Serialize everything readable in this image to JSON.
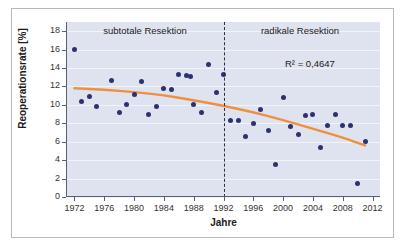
{
  "figure": {
    "background_color": "#ffffff",
    "frame_border_color": "#b8b8b8"
  },
  "chart_data": {
    "type": "scatter",
    "title": "",
    "xlabel": "Jahre",
    "ylabel": "Reoperationsrate [%]",
    "xlim": [
      1971,
      2013
    ],
    "ylim": [
      0,
      19
    ],
    "grid": true,
    "plot_background": "#dfe3ef",
    "point_color": "#2c3270",
    "trendline_color": "#ef9040",
    "xticks": [
      1972,
      1976,
      1980,
      1984,
      1988,
      1992,
      1996,
      2000,
      2004,
      2008,
      2012
    ],
    "xtick_labels": [
      "1972",
      "1976",
      "1980",
      "1984",
      "1988",
      "1992",
      "1996",
      "2000",
      "2004",
      "2008",
      "2012"
    ],
    "yticks": [
      0,
      2,
      4,
      6,
      8,
      10,
      12,
      14,
      16,
      18
    ],
    "ytick_labels": [
      "0",
      "2",
      "4",
      "6",
      "8",
      "10",
      "12",
      "14",
      "16",
      "18"
    ],
    "annotations": [
      {
        "name": "panel-label-left",
        "text": "subtotale Resektion",
        "x": 1981,
        "y": 18.7
      },
      {
        "name": "panel-label-right",
        "text": "radikale Resektion",
        "x": 2002,
        "y": 18.7
      },
      {
        "name": "r2-annotation",
        "text": "R² = 0,4647",
        "value": "0,4647",
        "x": 2006,
        "y": 15.2
      }
    ],
    "divider": {
      "x": 1992,
      "style": "dashed",
      "color": "#2b2f45"
    },
    "points": [
      {
        "x": 1972,
        "y": 16.0
      },
      {
        "x": 1973,
        "y": 10.35
      },
      {
        "x": 1974,
        "y": 10.9
      },
      {
        "x": 1975,
        "y": 9.8
      },
      {
        "x": 1977,
        "y": 12.6
      },
      {
        "x": 1978,
        "y": 9.15
      },
      {
        "x": 1979,
        "y": 10.05
      },
      {
        "x": 1980,
        "y": 11.1
      },
      {
        "x": 1981,
        "y": 12.5
      },
      {
        "x": 1982,
        "y": 8.95
      },
      {
        "x": 1983,
        "y": 9.8
      },
      {
        "x": 1984,
        "y": 11.75
      },
      {
        "x": 1985,
        "y": 11.65
      },
      {
        "x": 1986,
        "y": 13.35
      },
      {
        "x": 1987,
        "y": 13.2
      },
      {
        "x": 1987.6,
        "y": 13.05
      },
      {
        "x": 1988,
        "y": 10.0
      },
      {
        "x": 1989,
        "y": 9.15
      },
      {
        "x": 1990,
        "y": 14.4
      },
      {
        "x": 1991,
        "y": 11.4
      },
      {
        "x": 1992,
        "y": 13.3
      },
      {
        "x": 1993,
        "y": 8.3
      },
      {
        "x": 1994,
        "y": 8.35
      },
      {
        "x": 1995,
        "y": 6.55
      },
      {
        "x": 1996,
        "y": 7.95
      },
      {
        "x": 1997,
        "y": 9.5
      },
      {
        "x": 1998,
        "y": 7.2
      },
      {
        "x": 1999,
        "y": 3.55
      },
      {
        "x": 2000,
        "y": 10.85
      },
      {
        "x": 2001,
        "y": 7.7
      },
      {
        "x": 2002,
        "y": 6.8
      },
      {
        "x": 2003,
        "y": 8.8
      },
      {
        "x": 2004,
        "y": 9.0
      },
      {
        "x": 2005,
        "y": 5.4
      },
      {
        "x": 2006,
        "y": 7.75
      },
      {
        "x": 2007,
        "y": 8.95
      },
      {
        "x": 2008,
        "y": 7.75
      },
      {
        "x": 2009,
        "y": 7.75
      },
      {
        "x": 2010,
        "y": 1.5
      },
      {
        "x": 2011,
        "y": 6.0
      }
    ],
    "trendline": [
      {
        "x": 1972,
        "y": 11.8
      },
      {
        "x": 1976,
        "y": 11.65
      },
      {
        "x": 1980,
        "y": 11.4
      },
      {
        "x": 1984,
        "y": 11.05
      },
      {
        "x": 1988,
        "y": 10.5
      },
      {
        "x": 1992,
        "y": 9.9
      },
      {
        "x": 1996,
        "y": 9.2
      },
      {
        "x": 2000,
        "y": 8.35
      },
      {
        "x": 2004,
        "y": 7.4
      },
      {
        "x": 2008,
        "y": 6.45
      },
      {
        "x": 2011,
        "y": 5.6
      }
    ]
  }
}
